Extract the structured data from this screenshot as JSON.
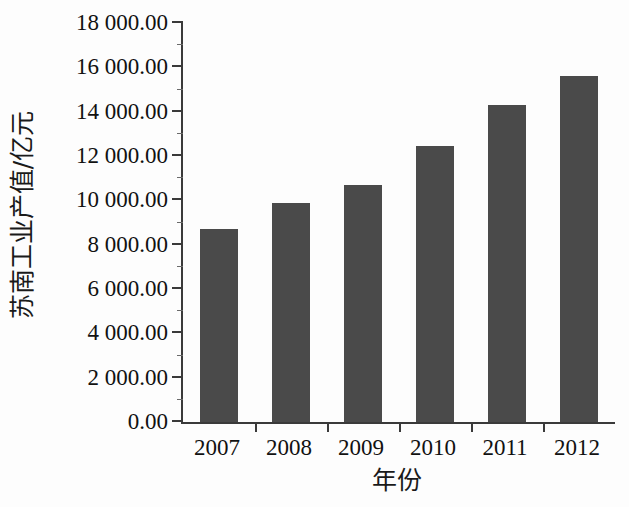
{
  "chart_data": {
    "type": "bar",
    "title": "",
    "subtitle": "",
    "xlabel": "年份",
    "ylabel": "苏南工业产值/亿元",
    "categories": [
      "2007",
      "2008",
      "2009",
      "2010",
      "2011",
      "2012"
    ],
    "values": [
      8700.0,
      9880.0,
      10690.0,
      12450.0,
      14300.0,
      15610.0
    ],
    "series": [
      {
        "name": "苏南工业产值",
        "values": [
          8700.0,
          9880.0,
          10690.0,
          12450.0,
          14300.0,
          15610.0
        ]
      }
    ],
    "ylim": [
      0,
      18000
    ],
    "ytick_values": [
      0,
      2000,
      4000,
      6000,
      8000,
      10000,
      12000,
      14000,
      16000,
      18000
    ],
    "ytick_labels": [
      "0.00",
      "2 000.00",
      "4 000.00",
      "6 000.00",
      "8 000.00",
      "10 000.00",
      "12 000.00",
      "14 000.00",
      "16 000.00",
      "18 000.00"
    ],
    "ytick_interval": 2000,
    "yminor_interval": 1000,
    "grid": false,
    "legend": false,
    "legend_position": "none",
    "bar_color": "#4a4a4a",
    "axis_color": "#3a3a3a",
    "background_color": "#fdfdfd",
    "annotations": []
  }
}
